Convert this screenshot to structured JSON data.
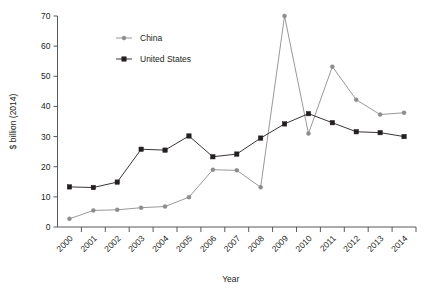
{
  "chart_data": {
    "type": "line",
    "title": "",
    "xlabel": "Year",
    "ylabel": "$ billion (2014)",
    "categories": [
      "2000",
      "2001",
      "2002",
      "2003",
      "2004",
      "2005",
      "2006",
      "2007",
      "2008",
      "2009",
      "2010",
      "2011",
      "2012",
      "2013",
      "2014"
    ],
    "ylim": [
      0,
      70
    ],
    "yticks": [
      0,
      10,
      20,
      30,
      40,
      50,
      60,
      70
    ],
    "ytick_labels": [
      "0",
      "10",
      "20",
      "30",
      "40",
      "50",
      "60",
      "70"
    ],
    "grid": false,
    "legend_position": "top-left-inside",
    "series": [
      {
        "name": "China",
        "color": "#8c8c8c",
        "marker": "circle",
        "values": [
          2.7,
          5.5,
          5.7,
          6.4,
          6.8,
          9.9,
          19.0,
          18.8,
          13.2,
          70.0,
          31.0,
          53.2,
          42.2,
          37.3,
          37.9
        ]
      },
      {
        "name": "United States",
        "color": "#231f20",
        "marker": "square",
        "values": [
          13.3,
          13.1,
          14.9,
          25.8,
          25.5,
          30.2,
          23.3,
          24.2,
          29.5,
          34.2,
          37.6,
          34.6,
          31.6,
          31.3,
          30.0
        ]
      }
    ]
  },
  "legend": {
    "items": [
      {
        "label": "China"
      },
      {
        "label": "United States"
      }
    ]
  },
  "axes": {
    "x_title": "Year",
    "y_title": "$ billion (2014)"
  }
}
